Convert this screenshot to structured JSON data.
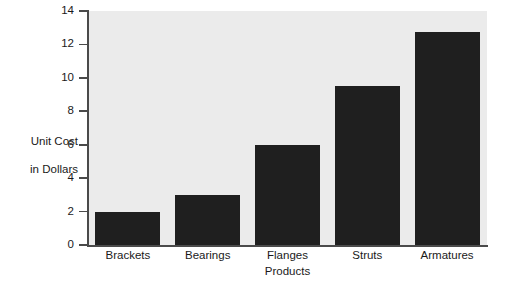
{
  "chart_data": {
    "type": "bar",
    "title": "",
    "categories": [
      "Brackets",
      "Bearings",
      "Flanges",
      "Struts",
      "Armatures"
    ],
    "values": [
      2,
      3,
      6,
      9.5,
      12.75
    ],
    "xlabel": "Products",
    "ylabel_lines": [
      "Unit Cost",
      "in Dollars"
    ],
    "ylabel": "Unit Cost in Dollars",
    "ylim": [
      0,
      14
    ],
    "ytick_step": 2,
    "yticks": [
      0,
      2,
      4,
      6,
      8,
      10,
      12,
      14
    ],
    "ytick_labels": [
      "0",
      "2",
      "4",
      "6",
      "8",
      "10",
      "12",
      "14"
    ],
    "grid": false,
    "legend": false,
    "bar_color": "#1f1f1f",
    "plot_background": "#ebebeb",
    "axis_color": "#4a4a4a",
    "figure_background": "#ffffff"
  }
}
